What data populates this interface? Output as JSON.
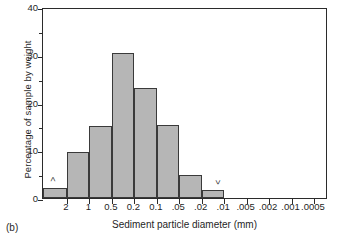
{
  "panel": {
    "label": "(b)"
  },
  "chart_data": {
    "type": "bar",
    "title": "",
    "subtitle": "",
    "xlabel": "Sediment particle diameter (mm)",
    "ylabel": "Percentage of sample by weight",
    "ylim": [
      0,
      40
    ],
    "yticks": [
      0,
      10,
      20,
      30,
      40
    ],
    "yticks_minor": [
      5,
      15,
      25,
      35
    ],
    "ytick_labels": [
      "0",
      "10",
      "20",
      "30",
      "40"
    ],
    "grid": false,
    "legend": null,
    "xtick_labels": [
      "2",
      "1",
      "0.5",
      "0.2",
      "0.1",
      ".05",
      ".02",
      ".01",
      ".005",
      ".002",
      ".001",
      ".0005"
    ],
    "categories": [
      "greater than 2",
      "2 to 1",
      "1 to 0.5",
      "0.5 to 0.2",
      "0.2 to 0.1",
      "0.1 to .05",
      ".05 to .02",
      ".02 to .01"
    ],
    "values": [
      2.2,
      9.6,
      15.0,
      30.3,
      23.1,
      15.2,
      4.9,
      1.7
    ],
    "annotations": [
      {
        "text": ">",
        "note": "greater-than marker above first bar"
      },
      {
        "text": "<",
        "note": "less-than marker above last bar"
      }
    ],
    "bar_fill_color": "#b6b6b6",
    "bar_edge_color": "#3a3a3a",
    "axis_color": "#2b2b2b"
  }
}
